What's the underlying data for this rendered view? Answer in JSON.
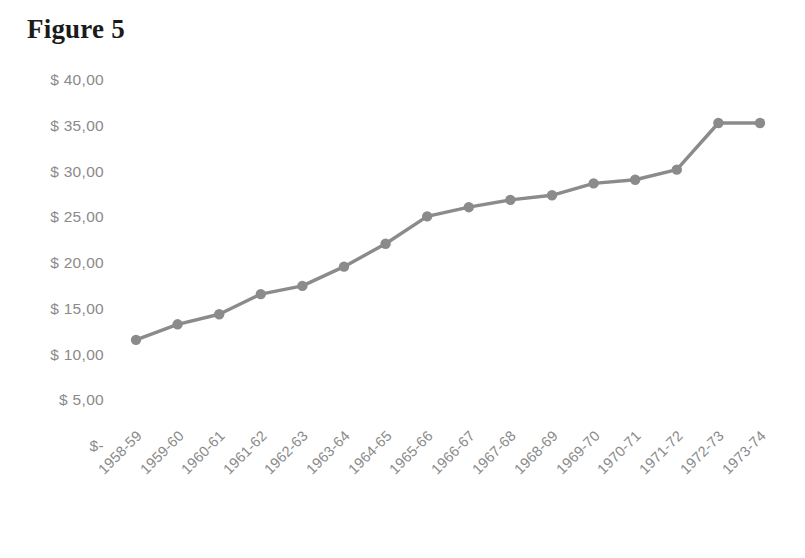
{
  "title": "Figure 5",
  "axis": {
    "y_ticks": [
      "$ 40,00",
      "$ 35,00",
      "$ 30,00",
      "$ 25,00",
      "$ 20,00",
      "$ 15,00",
      "$ 10,00",
      "$ 5,00",
      "$-"
    ],
    "x_ticks": [
      "1958-59",
      "1959-60",
      "1960-61",
      "1961-62",
      "1962-63",
      "1963-64",
      "1964-65",
      "1965-66",
      "1966-67",
      "1967-68",
      "1968-69",
      "1969-70",
      "1970-71",
      "1971-72",
      "1972-73",
      "1973-74"
    ]
  },
  "colors": {
    "series": "#8b8b8b",
    "tick_label": "#8a8a8a",
    "title": "#1b1b1b",
    "background": "#ffffff"
  },
  "chart_data": {
    "type": "line",
    "title": "Figure 5",
    "xlabel": "",
    "ylabel": "",
    "grid": false,
    "legend": false,
    "ylim": [
      0,
      40
    ],
    "ytick_values": [
      40,
      35,
      30,
      25,
      20,
      15,
      10,
      5,
      0
    ],
    "ytick_labels": [
      "$ 40,00",
      "$ 35,00",
      "$ 30,00",
      "$ 25,00",
      "$ 20,00",
      "$ 15,00",
      "$ 10,00",
      "$ 5,00",
      "$-"
    ],
    "categories": [
      "1958-59",
      "1959-60",
      "1960-61",
      "1961-62",
      "1962-63",
      "1963-64",
      "1964-65",
      "1965-66",
      "1966-67",
      "1967-68",
      "1968-69",
      "1969-70",
      "1970-71",
      "1971-72",
      "1972-73",
      "1973-74"
    ],
    "series": [
      {
        "name": "Series 1",
        "color": "#8b8b8b",
        "marker": "circle",
        "values": [
          11.6,
          13.3,
          14.4,
          16.6,
          17.5,
          19.6,
          22.1,
          25.1,
          26.1,
          26.9,
          27.4,
          28.7,
          29.1,
          30.2,
          35.3,
          35.3
        ]
      }
    ]
  }
}
